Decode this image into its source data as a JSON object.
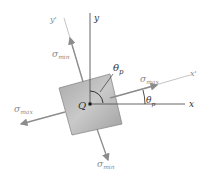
{
  "diagram": {
    "type": "principal-stress-element",
    "labels": {
      "y_axis": "y",
      "x_axis": "x",
      "y_prime": "y'",
      "x_prime": "x'",
      "origin": "Q",
      "theta_top": "θ",
      "theta_top_sub": "p",
      "theta_right": "θ",
      "theta_right_sub": "p",
      "sigma": "σ",
      "max": "max",
      "min": "min"
    },
    "rotation_deg": 16,
    "colors": {
      "axes": "#555555",
      "rotated_axes": "#aaaaaa",
      "arrows": "#8c8c8c",
      "element_fill": "#b8b8b8",
      "element_stroke": "#888888"
    }
  }
}
